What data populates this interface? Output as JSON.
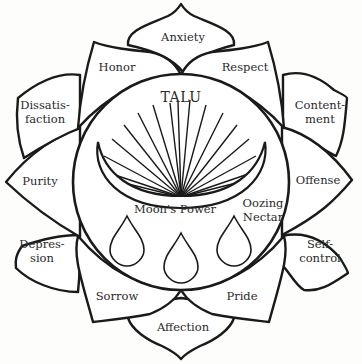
{
  "diagram": {
    "center": {
      "title": "TALU",
      "moon_label": "Moon's Power",
      "nectar_label": [
        "Oozing",
        "Nectar"
      ],
      "drop_count": 3
    },
    "petals": [
      {
        "id": "anxiety",
        "lines": [
          "Anxiety"
        ]
      },
      {
        "id": "respect",
        "lines": [
          "Respect"
        ]
      },
      {
        "id": "contentment",
        "lines": [
          "Content-",
          "ment"
        ]
      },
      {
        "id": "offense",
        "lines": [
          "Offense"
        ]
      },
      {
        "id": "self-control",
        "lines": [
          "Self-",
          "control"
        ]
      },
      {
        "id": "pride",
        "lines": [
          "Pride"
        ]
      },
      {
        "id": "affection",
        "lines": [
          "Affection"
        ]
      },
      {
        "id": "sorrow",
        "lines": [
          "Sorrow"
        ]
      },
      {
        "id": "depression",
        "lines": [
          "Depres-",
          "sion"
        ]
      },
      {
        "id": "purity",
        "lines": [
          "Purity"
        ]
      },
      {
        "id": "dissatisfaction",
        "lines": [
          "Dissatis-",
          "faction"
        ]
      },
      {
        "id": "honor",
        "lines": [
          "Honor"
        ]
      }
    ],
    "colors": {
      "stroke": "#1a1a1a",
      "fill": "#ffffff",
      "text": "#2a2a2a"
    }
  }
}
